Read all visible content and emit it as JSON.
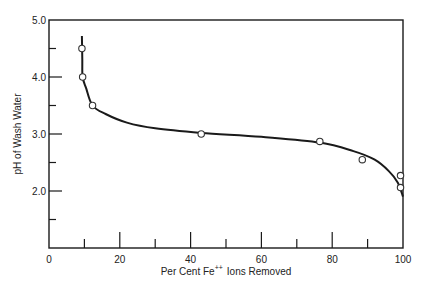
{
  "chart_data": {
    "type": "line",
    "title": "",
    "xlabel": "Per Cent Fe",
    "xlabel_superscript": "++",
    "xlabel_suffix": "Ions Removed",
    "ylabel": "pH of Wash Water",
    "xlim": [
      0,
      100
    ],
    "ylim": [
      1.0,
      5.0
    ],
    "x_ticks_major": [
      0,
      20,
      40,
      60,
      80,
      100
    ],
    "x_tick_labels": [
      "0",
      "20",
      "40",
      "60",
      "80",
      "100"
    ],
    "x_ticks_minor": [
      10,
      30,
      50,
      70,
      90
    ],
    "y_ticks_major": [
      2.0,
      3.0,
      4.0,
      5.0
    ],
    "y_tick_labels": [
      "2.0",
      "3.0",
      "4.0",
      "5.0"
    ],
    "y_ticks_minor": [
      1.5,
      2.5,
      3.5,
      4.5
    ],
    "grid": false,
    "legend": null,
    "series": [
      {
        "name": "measured points",
        "marker": "open-circle",
        "points": [
          {
            "x": 9.3,
            "y": 4.5
          },
          {
            "x": 9.5,
            "y": 4.0
          },
          {
            "x": 12.3,
            "y": 3.5
          },
          {
            "x": 43.0,
            "y": 3.0
          },
          {
            "x": 76.5,
            "y": 2.87
          },
          {
            "x": 88.5,
            "y": 2.55
          },
          {
            "x": 99.3,
            "y": 2.27
          },
          {
            "x": 99.3,
            "y": 2.06
          }
        ]
      },
      {
        "name": "fitted curve",
        "marker": "none",
        "points": [
          {
            "x": 9.3,
            "y": 4.72
          },
          {
            "x": 9.4,
            "y": 4.3
          },
          {
            "x": 9.5,
            "y": 4.0
          },
          {
            "x": 10.5,
            "y": 3.8
          },
          {
            "x": 12.3,
            "y": 3.5
          },
          {
            "x": 16,
            "y": 3.35
          },
          {
            "x": 22,
            "y": 3.2
          },
          {
            "x": 30,
            "y": 3.1
          },
          {
            "x": 43,
            "y": 3.02
          },
          {
            "x": 60,
            "y": 2.95
          },
          {
            "x": 76.5,
            "y": 2.85
          },
          {
            "x": 86,
            "y": 2.7
          },
          {
            "x": 92,
            "y": 2.55
          },
          {
            "x": 96,
            "y": 2.35
          },
          {
            "x": 98.5,
            "y": 2.15
          },
          {
            "x": 100,
            "y": 1.9
          }
        ]
      }
    ]
  }
}
